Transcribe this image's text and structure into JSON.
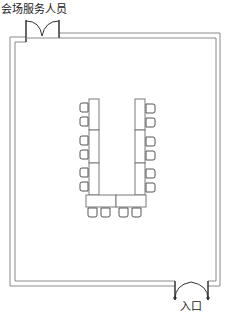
{
  "diagram": {
    "type": "floor-plan",
    "labels": {
      "service_door": "会场服务人员",
      "entrance": "入口"
    },
    "colors": {
      "wall": "#8a8a8a",
      "furniture": "#6a6a6a",
      "door": "#333333",
      "background": "#ffffff"
    },
    "room": {
      "outer": {
        "x": 10,
        "y": 33,
        "w": 210,
        "h": 253
      },
      "inner": {
        "x": 15,
        "y": 38,
        "w": 201,
        "h": 243
      }
    },
    "doors": [
      {
        "id": "service-door",
        "position": "top-left",
        "x1": 26,
        "x2": 59,
        "label_key": "service_door"
      },
      {
        "id": "entrance-door",
        "position": "bottom-right",
        "x1": 175,
        "x2": 208,
        "label_key": "entrance"
      }
    ],
    "tables": {
      "left_column_segments": 3,
      "right_column_segments": 3,
      "bottom_row_segments": 2
    },
    "chairs": {
      "left": 6,
      "right": 6,
      "bottom": 4,
      "total": 16
    }
  }
}
